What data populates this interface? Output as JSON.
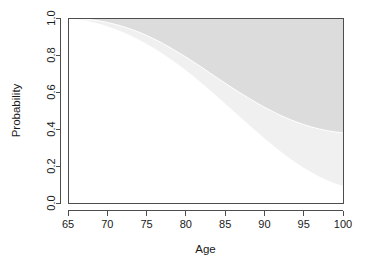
{
  "chart_data": {
    "type": "area",
    "title": "",
    "subtitle": "",
    "xlabel": "Age",
    "ylabel": "Probability",
    "xlim": [
      65,
      100
    ],
    "ylim": [
      0.0,
      1.0
    ],
    "grid": false,
    "legend": "none",
    "x_ticks": [
      65,
      70,
      75,
      80,
      85,
      90,
      95,
      100
    ],
    "x_tick_labels": [
      "65",
      "70",
      "75",
      "80",
      "85",
      "90",
      "95",
      "100"
    ],
    "y_ticks": [
      0.0,
      0.2,
      0.4,
      0.6,
      0.8,
      1.0
    ],
    "y_tick_labels": [
      "0.0",
      "0.2",
      "0.4",
      "0.6",
      "0.8",
      "1.0"
    ],
    "x": [
      65,
      66,
      67,
      68,
      69,
      70,
      71,
      72,
      73,
      74,
      75,
      76,
      77,
      78,
      79,
      80,
      81,
      82,
      83,
      84,
      85,
      86,
      87,
      88,
      89,
      90,
      91,
      92,
      93,
      94,
      95,
      96,
      97,
      98,
      99,
      100
    ],
    "series": [
      {
        "name": "upper-boundary",
        "description": "upper stacked cumulative probability curve (top of light-gray band)",
        "fill_color": "#dcdcdc",
        "values": [
          1.0,
          0.998,
          0.995,
          0.99,
          0.984,
          0.976,
          0.966,
          0.954,
          0.94,
          0.924,
          0.906,
          0.886,
          0.864,
          0.84,
          0.815,
          0.789,
          0.762,
          0.734,
          0.705,
          0.676,
          0.648,
          0.62,
          0.593,
          0.567,
          0.542,
          0.518,
          0.496,
          0.475,
          0.456,
          0.439,
          0.424,
          0.411,
          0.4,
          0.391,
          0.384,
          0.379
        ]
      },
      {
        "name": "lower-boundary",
        "description": "lower stacked cumulative probability curve (top of very-light band)",
        "fill_color": "#f0f0f0",
        "values": [
          0.998,
          0.993,
          0.986,
          0.977,
          0.966,
          0.953,
          0.938,
          0.921,
          0.902,
          0.881,
          0.858,
          0.833,
          0.806,
          0.777,
          0.747,
          0.715,
          0.681,
          0.646,
          0.61,
          0.573,
          0.535,
          0.497,
          0.459,
          0.421,
          0.384,
          0.347,
          0.312,
          0.278,
          0.246,
          0.216,
          0.188,
          0.163,
          0.14,
          0.12,
          0.103,
          0.09
        ]
      }
    ],
    "regions": [
      {
        "name": "top-band",
        "color": "#dcdcdc"
      },
      {
        "name": "middle-band",
        "color": "#f0f0f0"
      },
      {
        "name": "bottom-band",
        "color": "#ffffff"
      }
    ],
    "colors": {
      "top_band": "#dcdcdc",
      "middle_band": "#f0f0f0",
      "bottom_band": "#ffffff",
      "axis": "#4d4d4d",
      "text": "#1a1a1a",
      "background": "#ffffff"
    },
    "geometry": {
      "plot_left": 68,
      "plot_right": 343,
      "plot_top": 18,
      "plot_bottom": 203
    }
  }
}
